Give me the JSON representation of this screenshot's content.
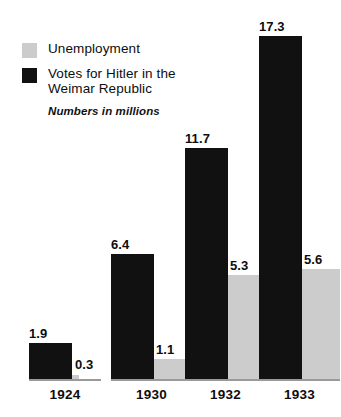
{
  "legend": {
    "items": [
      {
        "key": "unemployment",
        "label": "Unemployment",
        "label_line2": "",
        "color": "#cccccc",
        "swatch_icon": "legend-swatch-gray"
      },
      {
        "key": "votes",
        "label": "Votes for Hitler in the",
        "label_line2": "Weimar Republic",
        "color": "#111111",
        "swatch_icon": "legend-swatch-black"
      }
    ],
    "note": "Numbers in millions"
  },
  "chart_data": {
    "type": "bar",
    "title": "",
    "subtitle": "Numbers in millions",
    "xlabel": "",
    "ylabel": "",
    "unit": "millions",
    "categories": [
      "1924",
      "1930",
      "1932",
      "1933"
    ],
    "grid": false,
    "legend_position": "top-left",
    "ylim": [
      0,
      17.3
    ],
    "series": [
      {
        "name": "Votes for Hitler in the Weimar Republic",
        "color": "#111111",
        "values": [
          1.9,
          6.4,
          11.7,
          17.3
        ],
        "labels": [
          "1.9",
          "6.4",
          "11.7",
          "17.3"
        ]
      },
      {
        "name": "Unemployment",
        "color": "#cccccc",
        "values": [
          0.3,
          1.1,
          5.3,
          5.6
        ],
        "labels": [
          "0.3",
          "1.1",
          "5.3",
          "5.6"
        ]
      }
    ]
  }
}
